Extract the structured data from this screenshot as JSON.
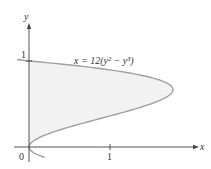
{
  "chart_data": {
    "type": "line",
    "title": "",
    "equation_label": "x = 12(y² − y³)",
    "xlabel": "x",
    "ylabel": "y",
    "x_ticks": [
      "0",
      "1"
    ],
    "y_ticks": [
      "1"
    ],
    "xlim": [
      -0.3,
      2.2
    ],
    "ylim": [
      -0.2,
      1.5
    ],
    "grid": false,
    "shaded_region": "area between curve and y-axis for 0 ≤ y ≤ 1",
    "series": [
      {
        "name": "x = 12(y^2 - y^3)",
        "points": [
          {
            "y": 0,
            "x": 0
          },
          {
            "y": 0.2,
            "x": 0.384
          },
          {
            "y": 0.4,
            "x": 1.152
          },
          {
            "y": 0.6,
            "x": 1.728
          },
          {
            "y": 0.667,
            "x": 1.778
          },
          {
            "y": 0.8,
            "x": 1.536
          },
          {
            "y": 1.0,
            "x": 0
          }
        ]
      }
    ]
  },
  "labels": {
    "origin": "0",
    "x_tick_1": "1",
    "y_tick_1": "1",
    "x_axis": "x",
    "y_axis": "y",
    "equation": "x = 12(y² − y³)"
  },
  "colors": {
    "curve": "#a0a0a0",
    "fill": "#f2f2f2",
    "axis": "#444444"
  }
}
